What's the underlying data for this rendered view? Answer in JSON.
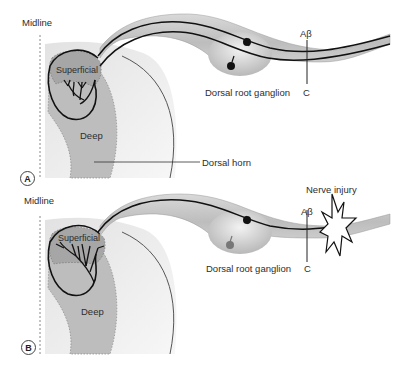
{
  "panels": [
    {
      "id": "A",
      "badge": "A",
      "labels": {
        "midline": "Midline",
        "superficial": "Superficial",
        "deep": "Deep",
        "dorsal_horn": "Dorsal horn",
        "drg": "Dorsal root ganglion",
        "abeta": "Aβ",
        "c": "C"
      }
    },
    {
      "id": "B",
      "badge": "B",
      "labels": {
        "midline": "Midline",
        "superficial": "Superficial",
        "deep": "Deep",
        "drg": "Dorsal root ganglion",
        "abeta": "Aβ",
        "c": "C",
        "injury": "Nerve injury"
      }
    }
  ],
  "colors": {
    "cord_light": "#ececec",
    "deep_gray": "#b9b9b9",
    "superficial_gray": "#a8a8a8",
    "nerve_fill": "#c8c8c8",
    "outline": "#111111"
  }
}
